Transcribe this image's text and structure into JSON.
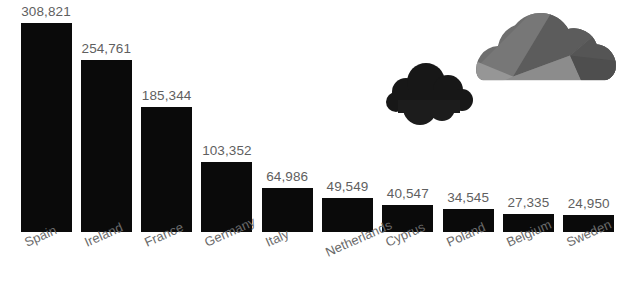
{
  "chart_data": {
    "type": "bar",
    "title": "",
    "subtitle": "",
    "xlabel": "",
    "ylabel": "",
    "grid": false,
    "legend": "none",
    "orientation": "vertical",
    "bar_color": "#0a0a0a",
    "label_color": "#5f5f5f",
    "background_color": "#ffffff",
    "ylim": [
      0,
      308821
    ],
    "categories": [
      "Spain",
      "Ireland",
      "France",
      "Germany",
      "Italy",
      "Netherlands",
      "Cyprus",
      "Poland",
      "Belgium",
      "Sweden"
    ],
    "values": [
      308821,
      254761,
      185344,
      103352,
      64986,
      49549,
      40547,
      34545,
      27335,
      24950
    ],
    "value_labels": [
      "308,821",
      "254,761",
      "185,344",
      "103,352",
      "64,986",
      "49,549",
      "40,547",
      "34,545",
      "27,335",
      "24,950"
    ],
    "annotations": [
      {
        "name": "dark-cloud",
        "color": "#171717"
      },
      {
        "name": "gray-cloud",
        "color": "#6b6b6b"
      }
    ]
  },
  "decor": {
    "dark_cloud_color": "#171717",
    "gray_cloud_light": "#8a8a8a",
    "gray_cloud_mid": "#6e6e6e",
    "gray_cloud_dark": "#4e4e4e"
  }
}
